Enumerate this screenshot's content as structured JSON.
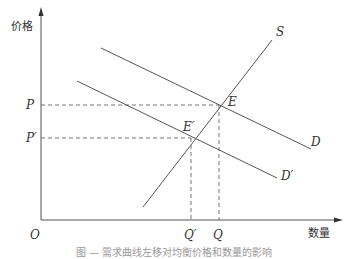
{
  "diagram": {
    "type": "supply-demand",
    "y_axis_label": "价格",
    "x_axis_label": "数量",
    "origin_label": "O",
    "curves": {
      "supply": "S",
      "demand": "D",
      "demand_shifted": "D′"
    },
    "points": {
      "equilibrium": "E",
      "equilibrium_shifted": "E′"
    },
    "price_labels": {
      "p": "P",
      "p_shifted": "P′"
    },
    "quantity_labels": {
      "q": "Q",
      "q_shifted": "Q′"
    },
    "caption": "图 — 需求曲线左移对均衡价格和数量的影响"
  },
  "colors": {
    "line": "#555555",
    "text": "#333333",
    "background": "#ffffff"
  }
}
